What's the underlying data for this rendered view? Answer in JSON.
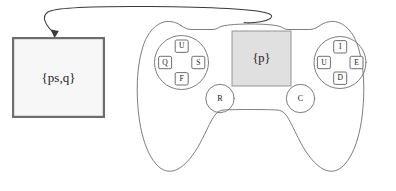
{
  "figure": {
    "background_color": "#ffffff",
    "line_color": "#6f6f74",
    "ink_color": "#1a1a1a"
  },
  "left_box": {
    "label": "{ps,q}",
    "fill_color": "#f7f7f7",
    "border_color": "#6b6b70"
  },
  "arrow": {
    "name": "curved-feedback-arrow",
    "direction": "right-to-left",
    "color": "#3a3a3e"
  },
  "controller": {
    "name": "gamepad",
    "outline_color": "#6f6f74",
    "touchpad": {
      "label": "{p}",
      "fill_color": "#e0e0e0",
      "border_color": "#8a8a8f"
    },
    "dpad_left": {
      "name": "left-button-cluster",
      "up": "U",
      "left": "Q",
      "right": "S",
      "down": "F"
    },
    "dpad_right": {
      "name": "right-button-cluster",
      "up": "I",
      "left": "U",
      "right": "E",
      "down": "D"
    },
    "stick_buttons": [
      {
        "name": "left-stick-button",
        "label": "R"
      },
      {
        "name": "right-stick-button",
        "label": "C"
      }
    ]
  }
}
